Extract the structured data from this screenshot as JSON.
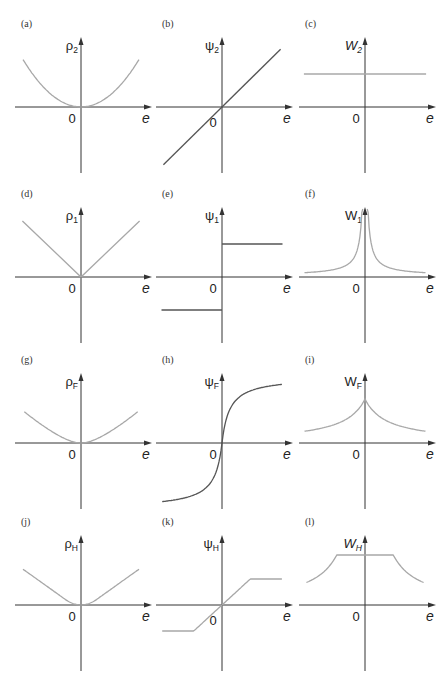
{
  "figure": {
    "panels": [
      {
        "id": "a",
        "label": "(a)",
        "ylabel_main": "ρ",
        "ylabel_sub": "2",
        "ylabel_italic": false,
        "xlabel": "e",
        "origin_label": "0",
        "curve": "quadratic",
        "color": "grey"
      },
      {
        "id": "b",
        "label": "(b)",
        "ylabel_main": "ψ",
        "ylabel_sub": "2",
        "ylabel_italic": false,
        "xlabel": "e",
        "origin_label": "0",
        "curve": "linear",
        "color": "dark"
      },
      {
        "id": "c",
        "label": "(c)",
        "ylabel_main": "W",
        "ylabel_sub": "2",
        "ylabel_italic": true,
        "xlabel": "e",
        "origin_label": "0",
        "curve": "constant",
        "color": "grey"
      },
      {
        "id": "d",
        "label": "(d)",
        "ylabel_main": "ρ",
        "ylabel_sub": "1",
        "ylabel_italic": false,
        "xlabel": "e",
        "origin_label": "0",
        "curve": "abs",
        "color": "grey"
      },
      {
        "id": "e",
        "label": "(e)",
        "ylabel_main": "ψ",
        "ylabel_sub": "1",
        "ylabel_italic": false,
        "xlabel": "e",
        "origin_label": "0",
        "curve": "sign",
        "color": "dark"
      },
      {
        "id": "f",
        "label": "(f)",
        "ylabel_main": "W",
        "ylabel_sub": "1",
        "ylabel_italic": false,
        "xlabel": "e",
        "origin_label": "0",
        "curve": "inverse_abs",
        "color": "grey"
      },
      {
        "id": "g",
        "label": "(g)",
        "ylabel_main": "ρ",
        "ylabel_sub": "F",
        "ylabel_italic": false,
        "xlabel": "e",
        "origin_label": "0",
        "curve": "fair_rho",
        "color": "grey"
      },
      {
        "id": "h",
        "label": "(h)",
        "ylabel_main": "ψ",
        "ylabel_sub": "F",
        "ylabel_italic": false,
        "xlabel": "e",
        "origin_label": "0",
        "curve": "fair_psi",
        "color": "dark"
      },
      {
        "id": "i",
        "label": "(i)",
        "ylabel_main": "W",
        "ylabel_sub": "F",
        "ylabel_italic": false,
        "xlabel": "e",
        "origin_label": "0",
        "curve": "fair_w",
        "color": "grey"
      },
      {
        "id": "j",
        "label": "(j)",
        "ylabel_main": "ρ",
        "ylabel_sub": "H",
        "ylabel_italic": false,
        "xlabel": "e",
        "origin_label": "0",
        "curve": "huber_rho",
        "color": "grey"
      },
      {
        "id": "k",
        "label": "(k)",
        "ylabel_main": "ψ",
        "ylabel_sub": "H",
        "ylabel_italic": false,
        "xlabel": "e",
        "origin_label": "0",
        "curve": "huber_psi",
        "color": "grey"
      },
      {
        "id": "l",
        "label": "(l)",
        "ylabel_main": "W",
        "ylabel_sub": "H",
        "ylabel_italic": true,
        "xlabel": "e",
        "origin_label": "0",
        "curve": "huber_w",
        "color": "grey"
      }
    ]
  },
  "chart_data": [
    {
      "type": "line",
      "title": "(a)",
      "xlabel": "e",
      "ylabel": "ρ2",
      "function": "e^2",
      "x": [
        -1,
        -0.5,
        0,
        0.5,
        1
      ],
      "y": [
        1,
        0.25,
        0,
        0.25,
        1
      ],
      "xlim": [
        -1,
        1
      ],
      "grid": false
    },
    {
      "type": "line",
      "title": "(b)",
      "xlabel": "e",
      "ylabel": "ψ2",
      "function": "e",
      "x": [
        -1,
        0,
        1
      ],
      "y": [
        -1,
        0,
        1
      ],
      "xlim": [
        -1,
        1
      ],
      "grid": false
    },
    {
      "type": "line",
      "title": "(c)",
      "xlabel": "e",
      "ylabel": "W2",
      "function": "1",
      "x": [
        -1,
        0,
        1
      ],
      "y": [
        1,
        1,
        1
      ],
      "xlim": [
        -1,
        1
      ],
      "grid": false
    },
    {
      "type": "line",
      "title": "(d)",
      "xlabel": "e",
      "ylabel": "ρ1",
      "function": "|e|",
      "x": [
        -1,
        0,
        1
      ],
      "y": [
        1,
        0,
        1
      ],
      "xlim": [
        -1,
        1
      ],
      "grid": false
    },
    {
      "type": "line",
      "title": "(e)",
      "xlabel": "e",
      "ylabel": "ψ1",
      "function": "sgn(e)",
      "x": [
        -1,
        0,
        0,
        1
      ],
      "y": [
        -1,
        -1,
        1,
        1
      ],
      "xlim": [
        -1,
        1
      ],
      "grid": false
    },
    {
      "type": "line",
      "title": "(f)",
      "xlabel": "e",
      "ylabel": "W1",
      "function": "1/|e|",
      "x": [
        -1,
        -0.5,
        -0.1,
        0.1,
        0.5,
        1
      ],
      "y": [
        1,
        2,
        10,
        10,
        2,
        1
      ],
      "xlim": [
        -1,
        1
      ],
      "grid": false
    },
    {
      "type": "line",
      "title": "(g)",
      "xlabel": "e",
      "ylabel": "ρF",
      "function": "c^2(|e|/c - ln(1+|e|/c))",
      "xlim": [
        -1,
        1
      ],
      "grid": false
    },
    {
      "type": "line",
      "title": "(h)",
      "xlabel": "e",
      "ylabel": "ψF",
      "function": "e/(1+|e|/c)",
      "xlim": [
        -1,
        1
      ],
      "grid": false
    },
    {
      "type": "line",
      "title": "(i)",
      "xlabel": "e",
      "ylabel": "WF",
      "function": "1/(1+|e|/c)",
      "xlim": [
        -1,
        1
      ],
      "grid": false
    },
    {
      "type": "line",
      "title": "(j)",
      "xlabel": "e",
      "ylabel": "ρH",
      "function": "e^2/2 if |e|<=k else k|e|-k^2/2",
      "xlim": [
        -1,
        1
      ],
      "grid": false
    },
    {
      "type": "line",
      "title": "(k)",
      "xlabel": "e",
      "ylabel": "ψH",
      "function": "e if |e|<=k else k·sgn(e)",
      "x": [
        -1,
        -0.45,
        0.45,
        1
      ],
      "y": [
        -0.45,
        -0.45,
        0.45,
        0.45
      ],
      "xlim": [
        -1,
        1
      ],
      "grid": false
    },
    {
      "type": "line",
      "title": "(l)",
      "xlabel": "e",
      "ylabel": "WH",
      "function": "1 if |e|<=k else k/|e|",
      "x": [
        -1,
        -0.45,
        0.45,
        1
      ],
      "y": [
        0.45,
        1,
        1,
        0.45
      ],
      "xlim": [
        -1,
        1
      ],
      "grid": false
    }
  ]
}
